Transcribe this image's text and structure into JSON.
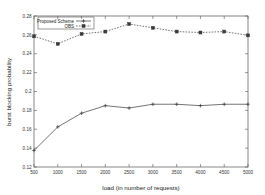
{
  "chart_data": {
    "type": "line",
    "title": "",
    "xlabel": "load (in number of requests)",
    "ylabel": "burst blocking probability",
    "x": [
      500,
      1000,
      1500,
      2000,
      2500,
      3000,
      3500,
      4000,
      4500,
      5000
    ],
    "categories": [
      "500",
      "1000",
      "1500",
      "2000",
      "2500",
      "3000",
      "3500",
      "4000",
      "4500",
      "5000"
    ],
    "xlim": [
      500,
      5000
    ],
    "ylim": [
      0.12,
      0.28
    ],
    "xticks": [
      500,
      1000,
      1500,
      2000,
      2500,
      3000,
      3500,
      4000,
      4500,
      5000
    ],
    "xtick_labels": [
      "500",
      "1000",
      "1500",
      "2000",
      "2500",
      "3000",
      "3500",
      "4000",
      "4500",
      "5000"
    ],
    "yticks": [
      0.12,
      0.14,
      0.16,
      0.18,
      0.2,
      0.22,
      0.24,
      0.26,
      0.28
    ],
    "ytick_labels": [
      "0.12",
      "0.14",
      "0.16",
      "0.18",
      "0.2",
      "0.22",
      "0.24",
      "0.26",
      "0.28"
    ],
    "grid": false,
    "legend_position": "top-left-inside",
    "series": [
      {
        "name": "Proposed Scheme",
        "marker": "plus",
        "linestyle": "solid",
        "color": "#3a3a3a",
        "values": [
          0.1375,
          0.1625,
          0.177,
          0.185,
          0.1825,
          0.1865,
          0.1865,
          0.185,
          0.1865,
          0.1865
        ]
      },
      {
        "name": "OBS",
        "marker": "square",
        "linestyle": "dotted",
        "color": "#3a3a3a",
        "values": [
          0.2585,
          0.2505,
          0.261,
          0.2635,
          0.2715,
          0.2675,
          0.2635,
          0.2625,
          0.2635,
          0.2595
        ]
      }
    ]
  },
  "legend": {
    "entries": [
      {
        "label": "Proposed Scheme"
      },
      {
        "label": "OBS"
      }
    ]
  },
  "colors": {
    "background": "#ffffff",
    "axis": "#555555",
    "ink": "#3a3a3a"
  }
}
